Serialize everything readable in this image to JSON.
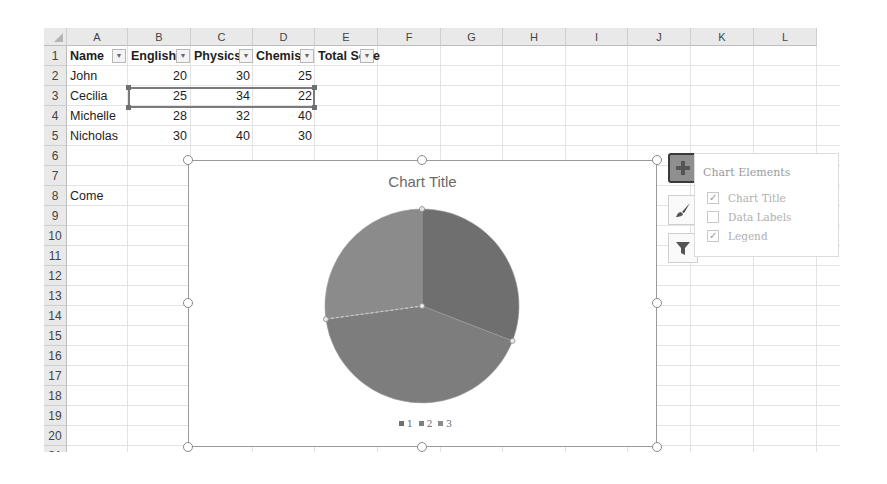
{
  "sheet": {
    "columns": [
      "A",
      "B",
      "C",
      "D",
      "E",
      "F",
      "G",
      "H",
      "I",
      "J",
      "K",
      "L"
    ],
    "rows": [
      "1",
      "2",
      "3",
      "4",
      "5",
      "6",
      "7",
      "8",
      "9",
      "10",
      "11",
      "12",
      "13",
      "14",
      "15",
      "16",
      "17",
      "18",
      "19",
      "20",
      "21"
    ],
    "header_row": [
      "Name",
      "English",
      "Physics",
      "Chemis",
      "Total Sc",
      "e"
    ],
    "data": [
      {
        "name": "John",
        "english": "20",
        "physics": "30",
        "chemistry": "25"
      },
      {
        "name": "Cecilia",
        "english": "25",
        "physics": "34",
        "chemistry": "22"
      },
      {
        "name": "Michelle",
        "english": "28",
        "physics": "32",
        "chemistry": "40"
      },
      {
        "name": "Nicholas",
        "english": "30",
        "physics": "40",
        "chemistry": "30"
      }
    ],
    "a8": "Come",
    "filter_glyph": "▼",
    "selected_range": "B3:D3"
  },
  "chart": {
    "title": "Chart Title",
    "legend": [
      {
        "label": "1",
        "color": "#6f6f6f"
      },
      {
        "label": "2",
        "color": "#7d7d7d"
      },
      {
        "label": "3",
        "color": "#8b8b8b"
      }
    ]
  },
  "side_buttons": [
    {
      "name": "chart-elements",
      "icon": "plus-icon",
      "active": true
    },
    {
      "name": "chart-styles",
      "icon": "brush-icon",
      "active": false
    },
    {
      "name": "chart-filters",
      "icon": "filter-icon",
      "active": false
    }
  ],
  "chart_elements_panel": {
    "title": "Chart Elements",
    "options": [
      {
        "label": "Chart Title",
        "checked": true
      },
      {
        "label": "Data Labels",
        "checked": false
      },
      {
        "label": "Legend",
        "checked": true
      }
    ],
    "check_glyph": "✓"
  },
  "chart_data": {
    "type": "pie",
    "title": "Chart Title",
    "categories": [
      "1",
      "2",
      "3"
    ],
    "values": [
      25,
      34,
      22
    ],
    "colors": [
      "#6f6f6f",
      "#7d7d7d",
      "#8b8b8b"
    ],
    "legend_position": "bottom",
    "source_row": "Cecilia (B3:D3)"
  }
}
